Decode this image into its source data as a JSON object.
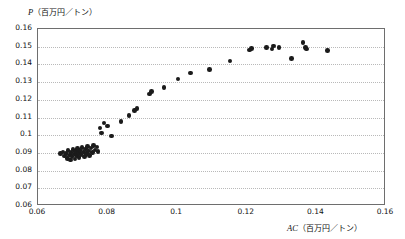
{
  "chart_data": {
    "type": "scatter",
    "title": "",
    "xlabel": "AC（百万円／トン）",
    "ylabel": "P（百万円／トン）",
    "xlabel_var": "AC",
    "xlabel_units": "（百万円／トン）",
    "ylabel_var": "P",
    "ylabel_units": "（百万円／トン）",
    "xlim": [
      0.06,
      0.16
    ],
    "ylim": [
      0.06,
      0.16
    ],
    "xticks": [
      0.06,
      0.08,
      0.1,
      0.12,
      0.14,
      0.16
    ],
    "xtick_labels": [
      "0.06",
      "0.08",
      "0.1",
      "0.12",
      "0.14",
      "0.16"
    ],
    "yticks": [
      0.06,
      0.07,
      0.08,
      0.09,
      0.1,
      0.11,
      0.12,
      0.13,
      0.14,
      0.15,
      0.16
    ],
    "ytick_labels": [
      "0.06",
      "0.07",
      "0.08",
      "0.09",
      "0.1",
      "0.11",
      "0.12",
      "0.13",
      "0.14",
      "0.15",
      "0.16"
    ],
    "grid": true,
    "grid_axis": "y",
    "grid_style": "dotted",
    "legend": null,
    "marker": "filled-circle",
    "marker_color": "#1b1b1b",
    "points": [
      {
        "x": 0.0665,
        "y": 0.0895
      },
      {
        "x": 0.0672,
        "y": 0.0905
      },
      {
        "x": 0.0676,
        "y": 0.0882
      },
      {
        "x": 0.068,
        "y": 0.0898
      },
      {
        "x": 0.0684,
        "y": 0.0869
      },
      {
        "x": 0.0686,
        "y": 0.0912
      },
      {
        "x": 0.069,
        "y": 0.0888
      },
      {
        "x": 0.0693,
        "y": 0.0861
      },
      {
        "x": 0.0695,
        "y": 0.0902
      },
      {
        "x": 0.0698,
        "y": 0.0878
      },
      {
        "x": 0.0701,
        "y": 0.0919
      },
      {
        "x": 0.0703,
        "y": 0.0893
      },
      {
        "x": 0.0706,
        "y": 0.0866
      },
      {
        "x": 0.0708,
        "y": 0.0908
      },
      {
        "x": 0.0711,
        "y": 0.0884
      },
      {
        "x": 0.0713,
        "y": 0.0926
      },
      {
        "x": 0.0716,
        "y": 0.0899
      },
      {
        "x": 0.0718,
        "y": 0.0873
      },
      {
        "x": 0.0721,
        "y": 0.0914
      },
      {
        "x": 0.0724,
        "y": 0.089
      },
      {
        "x": 0.0727,
        "y": 0.0931
      },
      {
        "x": 0.073,
        "y": 0.0905
      },
      {
        "x": 0.0733,
        "y": 0.0879
      },
      {
        "x": 0.0736,
        "y": 0.0921
      },
      {
        "x": 0.0739,
        "y": 0.0896
      },
      {
        "x": 0.0742,
        "y": 0.0937
      },
      {
        "x": 0.0745,
        "y": 0.0911
      },
      {
        "x": 0.0748,
        "y": 0.0886
      },
      {
        "x": 0.0752,
        "y": 0.0928
      },
      {
        "x": 0.0756,
        "y": 0.0902
      },
      {
        "x": 0.076,
        "y": 0.0943
      },
      {
        "x": 0.0764,
        "y": 0.0917
      },
      {
        "x": 0.0769,
        "y": 0.0934
      },
      {
        "x": 0.0773,
        "y": 0.0908
      },
      {
        "x": 0.0778,
        "y": 0.104
      },
      {
        "x": 0.0782,
        "y": 0.1012
      },
      {
        "x": 0.079,
        "y": 0.1068
      },
      {
        "x": 0.08,
        "y": 0.1051
      },
      {
        "x": 0.0812,
        "y": 0.0995
      },
      {
        "x": 0.0838,
        "y": 0.1079
      },
      {
        "x": 0.0862,
        "y": 0.111
      },
      {
        "x": 0.0878,
        "y": 0.114
      },
      {
        "x": 0.0884,
        "y": 0.1152
      },
      {
        "x": 0.092,
        "y": 0.1232
      },
      {
        "x": 0.0926,
        "y": 0.1246
      },
      {
        "x": 0.0962,
        "y": 0.1268
      },
      {
        "x": 0.1002,
        "y": 0.1318
      },
      {
        "x": 0.1038,
        "y": 0.1352
      },
      {
        "x": 0.1092,
        "y": 0.1372
      },
      {
        "x": 0.1152,
        "y": 0.142
      },
      {
        "x": 0.1208,
        "y": 0.1482
      },
      {
        "x": 0.1214,
        "y": 0.1489
      },
      {
        "x": 0.1256,
        "y": 0.1497
      },
      {
        "x": 0.1272,
        "y": 0.1486
      },
      {
        "x": 0.1276,
        "y": 0.1503
      },
      {
        "x": 0.1292,
        "y": 0.1494
      },
      {
        "x": 0.1328,
        "y": 0.1433
      },
      {
        "x": 0.1362,
        "y": 0.1524
      },
      {
        "x": 0.1368,
        "y": 0.1495
      },
      {
        "x": 0.1372,
        "y": 0.1487
      },
      {
        "x": 0.1432,
        "y": 0.148
      }
    ]
  }
}
